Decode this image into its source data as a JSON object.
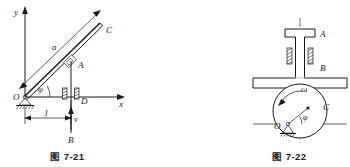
{
  "page": {
    "background_color": "#ffffff",
    "ink_color": "#1a1a1a"
  },
  "figures": [
    {
      "id": "fig-7-21",
      "caption": "图 7-21",
      "description": "Slotted rod OC pivoted at O rotating about fixed pin; vertical rod B slides in guide D and drives slider A along rod OC",
      "labels": {
        "axis_y": "y",
        "axis_x": "x",
        "origin": "O",
        "rod_end": "C",
        "rod_length": "a",
        "slider": "A",
        "guide": "D",
        "vertical_rod": "B",
        "velocity": "v",
        "angle": "φ",
        "distance": "l"
      }
    },
    {
      "id": "fig-7-22",
      "caption": "图 7-22",
      "description": "Flat-faced follower A guided by B, driven by an eccentric circular cam C pivoted at O rotating with angular velocity omega",
      "labels": {
        "follower": "A",
        "guide": "B",
        "cam_center": "C",
        "pivot": "O",
        "angular_velocity": "ω",
        "angle": "φ"
      }
    }
  ]
}
